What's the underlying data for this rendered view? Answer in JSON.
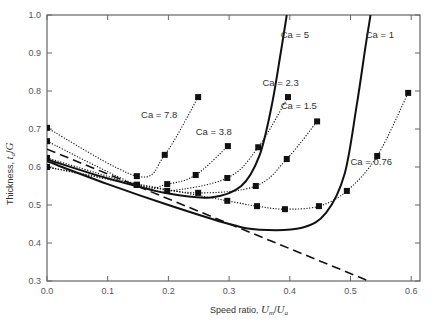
{
  "chart_data": {
    "type": "line",
    "title": "",
    "xlabel": "Speed ratio, U_m/U_a",
    "ylabel": "Thickness, t_a/G",
    "xlim": [
      0.0,
      0.62
    ],
    "ylim": [
      0.3,
      1.0
    ],
    "x_ticks": [
      "0.0",
      "0.1",
      "0.2",
      "0.3",
      "0.4",
      "0.5",
      "0.6"
    ],
    "y_ticks": [
      "0.3",
      "0.4",
      "0.5",
      "0.6",
      "0.7",
      "0.8",
      "0.9",
      "1.0"
    ],
    "grid": false,
    "legend": "inline annotations",
    "series": [
      {
        "name": "Ca = 7.8",
        "style": "dotted-markers",
        "label_pos": [
          0.155,
          0.73
        ],
        "points": [
          [
            0.0,
            0.703
          ],
          [
            0.148,
            0.576
          ],
          [
            0.194,
            0.632
          ],
          [
            0.249,
            0.784
          ]
        ]
      },
      {
        "name": "Ca = 3.8",
        "style": "dotted-markers",
        "label_pos": [
          0.245,
          0.685
        ],
        "points": [
          [
            0.0,
            0.668
          ],
          [
            0.148,
            0.553
          ],
          [
            0.198,
            0.555
          ],
          [
            0.245,
            0.579
          ],
          [
            0.298,
            0.655
          ]
        ]
      },
      {
        "name": "Ca = 2.3",
        "style": "dotted-markers",
        "label_pos": [
          0.355,
          0.812
        ],
        "points": [
          [
            0.0,
            0.624
          ],
          [
            0.148,
            0.553
          ],
          [
            0.198,
            0.537
          ],
          [
            0.297,
            0.571
          ],
          [
            0.348,
            0.652
          ],
          [
            0.397,
            0.784
          ]
        ]
      },
      {
        "name": "Ca = 1.5",
        "style": "dotted-markers",
        "label_pos": [
          0.385,
          0.752
        ],
        "points": [
          [
            0.0,
            0.6
          ],
          [
            0.148,
            0.553
          ],
          [
            0.249,
            0.532
          ],
          [
            0.344,
            0.55
          ],
          [
            0.395,
            0.621
          ],
          [
            0.445,
            0.72
          ]
        ]
      },
      {
        "name": "Ca = 0.76",
        "style": "dotted-markers",
        "label_pos": [
          0.5,
          0.605
        ],
        "points": [
          [
            0.0,
            0.6
          ],
          [
            0.297,
            0.511
          ],
          [
            0.346,
            0.497
          ],
          [
            0.392,
            0.489
          ],
          [
            0.448,
            0.497
          ],
          [
            0.494,
            0.537
          ],
          [
            0.544,
            0.629
          ],
          [
            0.595,
            0.795
          ]
        ]
      },
      {
        "name": "Ca = 5",
        "style": "solid",
        "label_pos": [
          0.385,
          0.94
        ],
        "points": [
          [
            0.0,
            0.62
          ],
          [
            0.1,
            0.57
          ],
          [
            0.2,
            0.53
          ],
          [
            0.27,
            0.52
          ],
          [
            0.32,
            0.55
          ],
          [
            0.35,
            0.63
          ],
          [
            0.37,
            0.76
          ],
          [
            0.385,
            0.9
          ],
          [
            0.395,
            1.0
          ]
        ]
      },
      {
        "name": "Ca = 1",
        "style": "solid",
        "label_pos": [
          0.525,
          0.94
        ],
        "points": [
          [
            0.0,
            0.615
          ],
          [
            0.1,
            0.555
          ],
          [
            0.2,
            0.5
          ],
          [
            0.3,
            0.45
          ],
          [
            0.35,
            0.435
          ],
          [
            0.42,
            0.44
          ],
          [
            0.46,
            0.48
          ],
          [
            0.49,
            0.58
          ],
          [
            0.51,
            0.76
          ],
          [
            0.525,
            0.92
          ],
          [
            0.533,
            1.0
          ]
        ]
      },
      {
        "name": "limit",
        "style": "dashed",
        "points": [
          [
            0.0,
            0.647
          ],
          [
            0.53,
            0.3
          ]
        ]
      }
    ]
  },
  "labels": {
    "xlabel_prefix": "Speed ratio, ",
    "xlabel_var": "U",
    "xlabel_sub1": "m",
    "xlabel_var2": "U",
    "xlabel_sub2": "a",
    "ylabel_prefix": "Thickness, ",
    "ylabel_var": "t",
    "ylabel_sub": "a",
    "ylabel_den": "G"
  }
}
